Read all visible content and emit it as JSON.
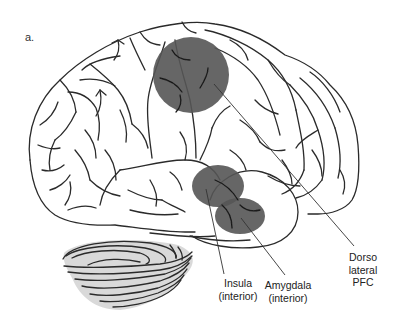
{
  "figure": {
    "panel_label": "a.",
    "view": "lateral brain",
    "highlight_color": "#555555",
    "regions": [
      {
        "id": "dlpfc",
        "lines": [
          "Dorso",
          "lateral",
          "PFC"
        ]
      },
      {
        "id": "insula",
        "lines": [
          "Insula",
          "(interior)"
        ]
      },
      {
        "id": "amygdala",
        "lines": [
          "Amygdala",
          "(interior)"
        ]
      }
    ]
  }
}
